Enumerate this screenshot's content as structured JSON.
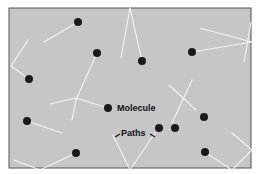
{
  "diagram": {
    "frame": {
      "x": 9,
      "y": 8,
      "width": 242,
      "height": 160,
      "fill": "#c6c6c6",
      "stroke": "#555555"
    },
    "molecule_color": "#1a1a1a",
    "path_color": "#f4f4f4",
    "labels": {
      "molecule": "Molecule",
      "paths": "Paths"
    },
    "molecules": [
      {
        "x": 78,
        "y": 22
      },
      {
        "x": 97,
        "y": 53
      },
      {
        "x": 142,
        "y": 61
      },
      {
        "x": 192,
        "y": 52
      },
      {
        "x": 29,
        "y": 79
      },
      {
        "x": 108,
        "y": 108
      },
      {
        "x": 27,
        "y": 121
      },
      {
        "x": 159,
        "y": 128
      },
      {
        "x": 175,
        "y": 128
      },
      {
        "x": 204,
        "y": 117
      },
      {
        "x": 76,
        "y": 153
      },
      {
        "x": 205,
        "y": 152
      }
    ],
    "paths": [
      [
        [
          78,
          22
        ],
        [
          44,
          42
        ]
      ],
      [
        [
          28,
          40
        ],
        [
          11,
          66
        ],
        [
          29,
          79
        ]
      ],
      [
        [
          97,
          53
        ],
        [
          76,
          100
        ],
        [
          72,
          120
        ]
      ],
      [
        [
          50,
          104
        ],
        [
          76,
          98
        ],
        [
          108,
          108
        ]
      ],
      [
        [
          130,
          8
        ],
        [
          121,
          58
        ]
      ],
      [
        [
          130,
          8
        ],
        [
          142,
          61
        ]
      ],
      [
        [
          192,
          52
        ],
        [
          252,
          42
        ],
        [
          200,
          28
        ]
      ],
      [
        [
          251,
          22
        ],
        [
          244,
          62
        ]
      ],
      [
        [
          27,
          121
        ],
        [
          62,
          133
        ]
      ],
      [
        [
          76,
          153
        ],
        [
          40,
          170
        ]
      ],
      [
        [
          14,
          160
        ],
        [
          40,
          170
        ]
      ],
      [
        [
          113,
          135
        ],
        [
          130,
          170
        ],
        [
          155,
          133
        ]
      ],
      [
        [
          169,
          85
        ],
        [
          196,
          110
        ]
      ],
      [
        [
          192,
          80
        ],
        [
          172,
          123
        ]
      ],
      [
        [
          205,
          152
        ],
        [
          232,
          170
        ],
        [
          252,
          150
        ],
        [
          232,
          133
        ]
      ]
    ]
  }
}
